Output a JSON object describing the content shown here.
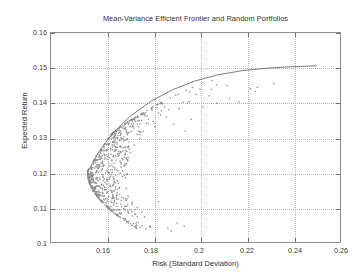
{
  "chart_data": {
    "type": "scatter",
    "title": "Mean-Variance Efficient Frontier and Random Portfolios",
    "xlabel": "Risk (Standard Deviation)",
    "ylabel": "Expected Return",
    "xlim": [
      0.1358,
      0.26
    ],
    "ylim": [
      0.1,
      0.16
    ],
    "grid": true,
    "legend": null,
    "xticks": [
      0.16,
      0.18,
      0.2,
      0.22,
      0.24,
      0.26
    ],
    "xtick_labels": [
      "0.16",
      "0.18",
      "0.2",
      "0.22",
      "0.24",
      "0.26"
    ],
    "yticks": [
      0.1,
      0.11,
      0.12,
      0.13,
      0.14,
      0.15,
      0.16
    ],
    "ytick_labels": [
      "0.1",
      "0.11",
      "0.12",
      "0.13",
      "0.14",
      "0.15",
      "0.16"
    ],
    "point_color": "#8a8a8a",
    "line_color": "#6b6b6b",
    "axis_color": "#8d8d8d",
    "grid_color": "#b4b4b4",
    "background": "#ffffff",
    "series": [
      {
        "name": "Efficient Frontier",
        "type": "line",
        "x": [
          0.1515,
          0.156,
          0.162,
          0.17,
          0.179,
          0.188,
          0.1975,
          0.2075,
          0.218,
          0.2285,
          0.239,
          0.25
        ],
        "y": [
          0.12,
          0.1255,
          0.131,
          0.1362,
          0.1405,
          0.1437,
          0.1462,
          0.148,
          0.1492,
          0.1499,
          0.1503,
          0.1506
        ]
      },
      {
        "name": "Random Portfolios",
        "type": "scatter",
        "n_points": 760,
        "vertex": [
          0.1515,
          0.12
        ],
        "upper_edge_note": "points hug just beneath the efficient frontier curve",
        "lower_tail_note": "sparse points extend to about (0.190, 0.103)",
        "x_range": [
          0.1515,
          0.2315
        ],
        "y_range": [
          0.1028,
          0.1465
        ]
      }
    ]
  }
}
